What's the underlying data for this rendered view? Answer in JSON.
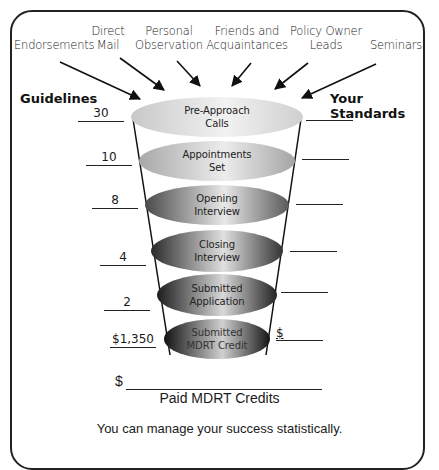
{
  "sources": [
    {
      "label": "Endorsements"
    },
    {
      "label": "Direct\nMail"
    },
    {
      "label": "Personal\nObservation"
    },
    {
      "label": "Friends and\nAcquaintances"
    },
    {
      "label": "Policy Owner\nLeads"
    },
    {
      "label": "Seminars"
    }
  ],
  "headers": {
    "left": "Guidelines",
    "right": "Your Standards"
  },
  "stages": [
    {
      "line1": "Pre-Approach",
      "line2": "Calls",
      "guideline": "30",
      "standard": ""
    },
    {
      "line1": "Appointments",
      "line2": "Set",
      "guideline": "10",
      "standard": ""
    },
    {
      "line1": "Opening",
      "line2": "Interview",
      "guideline": "8",
      "standard": ""
    },
    {
      "line1": "Closing",
      "line2": "Interview",
      "guideline": "4",
      "standard": ""
    },
    {
      "line1": "Submitted",
      "line2": "Application",
      "guideline": "2",
      "standard": ""
    },
    {
      "line1": "Submitted",
      "line2": "MDRT Credit",
      "guideline": "$1,350",
      "standard": "$"
    }
  ],
  "paid": {
    "currency": "$",
    "label": "Paid MDRT Credits"
  },
  "footer": "You can manage your success statistically."
}
